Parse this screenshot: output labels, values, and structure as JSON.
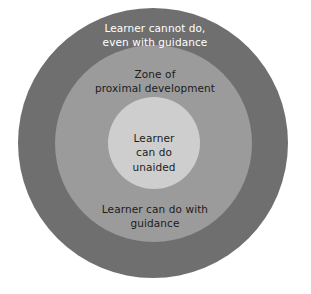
{
  "diagram": {
    "title": "Zone of proximal development",
    "type": "concentric-circles",
    "background_color": "#ffffff",
    "rings": [
      {
        "id": "outer",
        "name": "learner-cannot-do",
        "label": "Learner cannot do,\neven with guidance",
        "fill_color": "#6f6f6f",
        "text_color": "#ffffff",
        "diameter_px": 270
      },
      {
        "id": "middle",
        "name": "zone-of-proximal-development",
        "label_top": "Zone of\nproximal development",
        "label_bottom": "Learner can do with\nguidance",
        "fill_color": "#9b9b9b",
        "text_color": "#1c1c1c",
        "diameter_px": 197
      },
      {
        "id": "inner",
        "name": "learner-can-do-unaided",
        "label": "Learner\ncan do\nunaided",
        "fill_color": "#cecece",
        "text_color": "#1c1c1c",
        "diameter_px": 92
      }
    ],
    "caption_fragment": ""
  }
}
